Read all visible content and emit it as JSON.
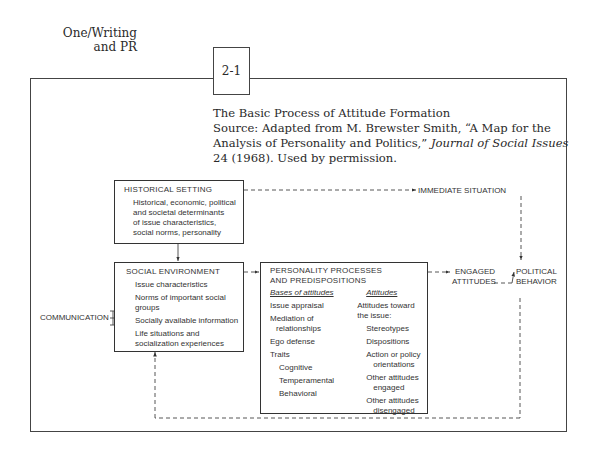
{
  "header": {
    "section_line1": "One/Writing",
    "section_line2": "and PR"
  },
  "figure": {
    "number": "2-1",
    "title": "The Basic Process of Attitude Formation",
    "source_prefix": "Source:",
    "source_text": " Adapted from M. Brewster Smith, “A Map for the Analysis of Personality and Politics,” ",
    "source_journal": "Journal of Social Issues",
    "source_suffix": " 24 (1968). Used by permission."
  },
  "diagram": {
    "historical_setting": {
      "title": "HISTORICAL SETTING",
      "lines": [
        "Historical, economic, political",
        "and societal determinants",
        "of issue characteristics,",
        "social norms, personality"
      ]
    },
    "social_environment": {
      "title": "SOCIAL ENVIRONMENT",
      "items": [
        {
          "line1": "Issue characteristics",
          "line2": ""
        },
        {
          "line1": "Norms of important social",
          "line2": "groups"
        },
        {
          "line1": "Socially available information",
          "line2": ""
        },
        {
          "line1": "Life situations and",
          "line2": "socialization experiences"
        }
      ]
    },
    "personality": {
      "title_line1": "PERSONALITY PROCESSES",
      "title_line2": "AND PREDISPOSITIONS",
      "bases_header": "Bases of attitudes",
      "bases": [
        {
          "line1": "Issue appraisal",
          "line2": ""
        },
        {
          "line1": "Mediation of",
          "line2": "relationships"
        },
        {
          "line1": "Ego defense",
          "line2": ""
        },
        {
          "line1": "Traits",
          "line2": ""
        }
      ],
      "traits": [
        "Cognitive",
        "Temperamental",
        "Behavioral"
      ],
      "attitudes_header": "Attitudes",
      "attitudes_intro_line1": "Attitudes toward",
      "attitudes_intro_line2": "the issue:",
      "attitudes": [
        {
          "line1": "Stereotypes",
          "line2": ""
        },
        {
          "line1": "Dispositions",
          "line2": ""
        },
        {
          "line1": "Action or policy",
          "line2": "orientations"
        },
        {
          "line1": "Other attitudes",
          "line2": "engaged"
        },
        {
          "line1": "Other attitudes",
          "line2": "disengaged"
        }
      ]
    },
    "communication": "COMMUNICATION",
    "immediate_situation": "IMMEDIATE SITUATION",
    "engaged_attitudes_line1": "ENGAGED",
    "engaged_attitudes_line2": "ATTITUDES",
    "political_behavior_line1": "POLITICAL",
    "political_behavior_line2": "BEHAVIOR"
  }
}
